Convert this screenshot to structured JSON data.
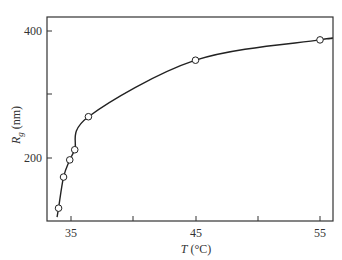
{
  "chart_data": {
    "type": "line",
    "title": "",
    "xlabel": "T (°C)",
    "xlabel_var": "T",
    "xlabel_unit": "(°C)",
    "ylabel": "Rg (nm)",
    "ylabel_var": "R",
    "ylabel_sub": "g",
    "ylabel_unit": "(nm)",
    "xlim": [
      33.0,
      56.0
    ],
    "ylim": [
      100,
      420
    ],
    "x_ticks": [
      35,
      40,
      45,
      50,
      55
    ],
    "x_tick_labels": [
      "35",
      "",
      "45",
      "",
      "55"
    ],
    "y_ticks": [
      200,
      300,
      400
    ],
    "y_tick_labels": [
      "200",
      "",
      "400"
    ],
    "grid": false,
    "legend": null,
    "series": [
      {
        "name": "Rg",
        "marker": "open-circle",
        "x": [
          34.0,
          34.4,
          34.9,
          35.3,
          36.4,
          45.0,
          55.0
        ],
        "y": [
          121,
          170,
          197,
          213,
          265,
          354,
          386
        ]
      }
    ]
  }
}
